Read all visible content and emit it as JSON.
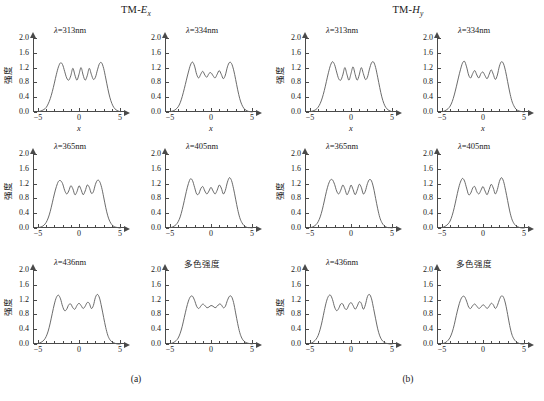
{
  "figure": {
    "groups": [
      {
        "id": "a",
        "title_prefix": "TM-",
        "title_symbol": "E",
        "title_sub": "x",
        "caption": "(a)",
        "panels": [
          {
            "title": "λ=313nm",
            "lambda_nm": 313,
            "is_cjk": false
          },
          {
            "title": "λ=334nm",
            "lambda_nm": 334,
            "is_cjk": false
          },
          {
            "title": "λ=365nm",
            "lambda_nm": 365,
            "is_cjk": false
          },
          {
            "title": "λ=405nm",
            "lambda_nm": 405,
            "is_cjk": false
          },
          {
            "title": "λ=436nm",
            "lambda_nm": 436,
            "is_cjk": false
          },
          {
            "title": "多色强度",
            "lambda_nm": null,
            "is_cjk": true
          }
        ]
      },
      {
        "id": "b",
        "title_prefix": "TM-",
        "title_symbol": "H",
        "title_sub": "y",
        "caption": "(b)",
        "panels": [
          {
            "title": "λ=313nm",
            "lambda_nm": 313,
            "is_cjk": false
          },
          {
            "title": "λ=334nm",
            "lambda_nm": 334,
            "is_cjk": false
          },
          {
            "title": "λ=365nm",
            "lambda_nm": 365,
            "is_cjk": false
          },
          {
            "title": "λ=405nm",
            "lambda_nm": 405,
            "is_cjk": false
          },
          {
            "title": "λ=436nm",
            "lambda_nm": 436,
            "is_cjk": false
          },
          {
            "title": "多色强度",
            "lambda_nm": null,
            "is_cjk": true
          }
        ]
      }
    ]
  },
  "axes": {
    "xlabel": "x",
    "ylabel": "强度",
    "xlim": [
      -5.6,
      5.6
    ],
    "ylim": [
      0.0,
      2.0
    ],
    "xticks": [
      -5,
      0,
      5
    ],
    "xtick_labels": [
      "−5",
      "0",
      "5"
    ],
    "yticks": [
      0.0,
      0.4,
      0.8,
      1.2,
      1.6,
      2.0
    ],
    "ytick_labels": [
      "0.0",
      "0.4",
      "0.8",
      "1.2",
      "1.6",
      "2.0"
    ],
    "x_minor_step": 1,
    "grid": false,
    "curve_color": "#5a5a5a",
    "axis_color": "#4a4a4a"
  },
  "chart_data": {
    "type": "line",
    "xlabel": "x",
    "ylabel": "强度",
    "xlim": [
      -5.6,
      5.6
    ],
    "ylim": [
      0.0,
      2.0
    ],
    "legend_position": "none",
    "grid": false,
    "x": [
      -5.0,
      -4.75,
      -4.5,
      -4.25,
      -4.0,
      -3.75,
      -3.5,
      -3.25,
      -3.0,
      -2.75,
      -2.5,
      -2.25,
      -2.0,
      -1.75,
      -1.5,
      -1.25,
      -1.0,
      -0.75,
      -0.5,
      -0.25,
      0.0,
      0.25,
      0.5,
      0.75,
      1.0,
      1.25,
      1.5,
      1.75,
      2.0,
      2.25,
      2.5,
      2.75,
      3.0,
      3.25,
      3.5,
      3.75,
      4.0,
      4.25,
      4.5,
      4.75,
      5.0
    ],
    "series": [
      {
        "name": "a-313nm",
        "group": "a",
        "panel_title": "λ=313nm",
        "values": [
          0.01,
          0.02,
          0.04,
          0.07,
          0.12,
          0.22,
          0.36,
          0.55,
          0.78,
          1.02,
          1.22,
          1.33,
          1.28,
          1.1,
          0.92,
          0.86,
          0.98,
          1.18,
          1.0,
          0.86,
          1.02,
          1.2,
          1.0,
          0.86,
          0.98,
          1.18,
          1.02,
          0.88,
          0.94,
          1.14,
          1.31,
          1.33,
          1.18,
          0.92,
          0.64,
          0.4,
          0.23,
          0.12,
          0.06,
          0.03,
          0.01
        ]
      },
      {
        "name": "a-334nm",
        "group": "a",
        "panel_title": "λ=334nm",
        "values": [
          0.01,
          0.02,
          0.04,
          0.08,
          0.14,
          0.25,
          0.42,
          0.63,
          0.86,
          1.08,
          1.27,
          1.35,
          1.24,
          1.02,
          0.92,
          1.02,
          1.1,
          1.0,
          0.94,
          1.04,
          1.06,
          0.98,
          0.92,
          1.02,
          1.12,
          1.02,
          0.9,
          1.0,
          1.22,
          1.34,
          1.31,
          1.14,
          0.88,
          0.6,
          0.36,
          0.2,
          0.1,
          0.05,
          0.02,
          0.01,
          0.0
        ]
      },
      {
        "name": "a-365nm",
        "group": "a",
        "panel_title": "λ=365nm",
        "values": [
          0.01,
          0.02,
          0.04,
          0.08,
          0.15,
          0.27,
          0.45,
          0.68,
          0.92,
          1.12,
          1.26,
          1.28,
          1.2,
          1.02,
          0.92,
          1.0,
          1.14,
          1.06,
          0.9,
          0.98,
          1.14,
          1.04,
          0.9,
          1.0,
          1.16,
          1.1,
          0.94,
          0.98,
          1.18,
          1.29,
          1.26,
          1.1,
          0.84,
          0.56,
          0.33,
          0.18,
          0.09,
          0.04,
          0.02,
          0.01,
          0.0
        ]
      },
      {
        "name": "a-405nm",
        "group": "a",
        "panel_title": "λ=405nm",
        "values": [
          0.01,
          0.02,
          0.05,
          0.09,
          0.17,
          0.3,
          0.5,
          0.74,
          0.99,
          1.2,
          1.33,
          1.28,
          1.1,
          0.92,
          0.92,
          1.06,
          1.12,
          1.0,
          0.92,
          1.0,
          1.1,
          1.0,
          0.92,
          1.02,
          1.16,
          1.08,
          0.92,
          1.02,
          1.24,
          1.36,
          1.28,
          1.06,
          0.78,
          0.5,
          0.28,
          0.15,
          0.07,
          0.03,
          0.01,
          0.01,
          0.0
        ]
      },
      {
        "name": "a-436nm",
        "group": "a",
        "panel_title": "λ=436nm",
        "values": [
          0.01,
          0.03,
          0.06,
          0.11,
          0.2,
          0.35,
          0.57,
          0.83,
          1.08,
          1.26,
          1.32,
          1.22,
          1.02,
          0.9,
          0.94,
          1.06,
          1.08,
          0.98,
          0.94,
          1.04,
          1.1,
          1.04,
          0.96,
          1.02,
          1.12,
          1.1,
          0.96,
          1.04,
          1.26,
          1.34,
          1.24,
          1.0,
          0.72,
          0.45,
          0.24,
          0.12,
          0.06,
          0.03,
          0.01,
          0.0,
          0.0
        ]
      },
      {
        "name": "a-polychromatic",
        "group": "a",
        "panel_title": "多色强度",
        "values": [
          0.01,
          0.02,
          0.05,
          0.09,
          0.16,
          0.29,
          0.48,
          0.72,
          0.96,
          1.16,
          1.28,
          1.29,
          1.18,
          1.02,
          0.96,
          1.02,
          1.08,
          1.04,
          0.98,
          1.0,
          1.04,
          1.02,
          0.98,
          1.02,
          1.08,
          1.06,
          0.98,
          1.02,
          1.18,
          1.29,
          1.28,
          1.12,
          0.84,
          0.55,
          0.31,
          0.16,
          0.08,
          0.04,
          0.02,
          0.01,
          0.0
        ]
      },
      {
        "name": "b-313nm",
        "group": "b",
        "panel_title": "λ=313nm",
        "values": [
          0.01,
          0.02,
          0.04,
          0.07,
          0.13,
          0.23,
          0.38,
          0.58,
          0.82,
          1.06,
          1.26,
          1.36,
          1.28,
          1.08,
          0.9,
          0.86,
          1.0,
          1.2,
          1.02,
          0.86,
          1.04,
          1.22,
          1.02,
          0.86,
          1.0,
          1.2,
          1.04,
          0.88,
          0.94,
          1.16,
          1.33,
          1.35,
          1.2,
          0.94,
          0.66,
          0.41,
          0.23,
          0.12,
          0.06,
          0.03,
          0.01
        ]
      },
      {
        "name": "b-334nm",
        "group": "b",
        "panel_title": "λ=334nm",
        "values": [
          0.01,
          0.02,
          0.05,
          0.09,
          0.16,
          0.28,
          0.46,
          0.68,
          0.92,
          1.14,
          1.32,
          1.37,
          1.22,
          1.0,
          0.92,
          1.04,
          1.12,
          1.0,
          0.92,
          1.04,
          1.08,
          0.98,
          0.9,
          1.02,
          1.14,
          1.02,
          0.88,
          1.0,
          1.24,
          1.36,
          1.3,
          1.1,
          0.82,
          0.54,
          0.31,
          0.17,
          0.08,
          0.04,
          0.02,
          0.01,
          0.0
        ]
      },
      {
        "name": "b-365nm",
        "group": "b",
        "panel_title": "λ=365nm",
        "values": [
          0.01,
          0.02,
          0.05,
          0.09,
          0.17,
          0.3,
          0.49,
          0.73,
          0.98,
          1.18,
          1.3,
          1.3,
          1.18,
          1.0,
          0.92,
          1.02,
          1.16,
          1.06,
          0.9,
          1.0,
          1.16,
          1.04,
          0.9,
          1.02,
          1.18,
          1.1,
          0.92,
          1.0,
          1.2,
          1.31,
          1.27,
          1.08,
          0.8,
          0.52,
          0.29,
          0.15,
          0.07,
          0.03,
          0.01,
          0.01,
          0.0
        ]
      },
      {
        "name": "b-405nm",
        "group": "b",
        "panel_title": "λ=405nm",
        "values": [
          0.01,
          0.03,
          0.06,
          0.11,
          0.19,
          0.34,
          0.55,
          0.8,
          1.05,
          1.24,
          1.34,
          1.27,
          1.08,
          0.9,
          0.94,
          1.08,
          1.12,
          0.98,
          0.92,
          1.02,
          1.12,
          1.0,
          0.9,
          1.04,
          1.18,
          1.08,
          0.92,
          1.04,
          1.26,
          1.36,
          1.26,
          1.02,
          0.74,
          0.46,
          0.25,
          0.13,
          0.06,
          0.03,
          0.01,
          0.0,
          0.0
        ]
      },
      {
        "name": "b-436nm",
        "group": "b",
        "panel_title": "λ=436nm",
        "values": [
          0.01,
          0.03,
          0.07,
          0.13,
          0.23,
          0.4,
          0.63,
          0.9,
          1.14,
          1.29,
          1.32,
          1.2,
          1.0,
          0.9,
          0.96,
          1.08,
          1.08,
          0.96,
          0.94,
          1.06,
          1.12,
          1.04,
          0.94,
          1.02,
          1.14,
          1.1,
          0.94,
          1.06,
          1.28,
          1.34,
          1.22,
          0.96,
          0.68,
          0.41,
          0.22,
          0.11,
          0.05,
          0.02,
          0.01,
          0.0,
          0.0
        ]
      },
      {
        "name": "b-polychromatic",
        "group": "b",
        "panel_title": "多色强度",
        "values": [
          0.01,
          0.02,
          0.05,
          0.1,
          0.18,
          0.32,
          0.52,
          0.77,
          1.0,
          1.18,
          1.28,
          1.28,
          1.16,
          1.0,
          0.96,
          1.04,
          1.08,
          1.02,
          0.96,
          1.0,
          1.06,
          1.02,
          0.96,
          1.02,
          1.1,
          1.06,
          0.96,
          1.04,
          1.2,
          1.3,
          1.26,
          1.08,
          0.8,
          0.5,
          0.27,
          0.14,
          0.07,
          0.03,
          0.01,
          0.0,
          0.0
        ]
      }
    ]
  }
}
